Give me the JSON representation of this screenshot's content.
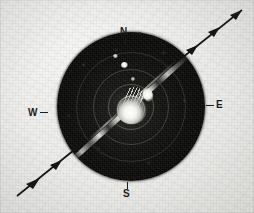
{
  "figure": {
    "type": "radar-ppi-scope-photograph",
    "background_color": "#ecece9",
    "scope_color": "#0a0a09",
    "ink_color": "#1c1c1c",
    "echo_color": "#ffffff"
  },
  "compass": {
    "north": {
      "label": "N",
      "icon": "compass-north-tick"
    },
    "east": {
      "label": "E",
      "icon": "compass-east-tick"
    },
    "south": {
      "label": "S",
      "icon": "compass-south-tick"
    },
    "west": {
      "label": "W",
      "icon": "compass-west-tick"
    }
  },
  "scope": {
    "display_name": "PPI radar scope",
    "range_rings": [
      1,
      2,
      3,
      4
    ],
    "echo_band": {
      "name": "bright echo band",
      "orientation": "SW-NE",
      "angle_deg": -42
    },
    "center_return": {
      "name": "saturated center return"
    },
    "echo_blobs": [
      "b1",
      "b2",
      "b3",
      "b4"
    ]
  },
  "annotations": {
    "flow_arrows": [
      {
        "id": "ne",
        "direction": "northeast",
        "arrowheads": 3
      },
      {
        "id": "sw",
        "direction": "northeast",
        "arrowheads": 3
      }
    ]
  }
}
